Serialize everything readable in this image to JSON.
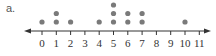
{
  "problem_label": "a.",
  "chart_data": {
    "type": "scatter",
    "subtype": "dot_plot",
    "title": "",
    "xlabel": "",
    "ylabel": "",
    "x_ticks": [
      0,
      1,
      2,
      3,
      4,
      5,
      6,
      7,
      8,
      9,
      10,
      11
    ],
    "xlim": [
      0,
      11
    ],
    "counts": {
      "0": 1,
      "1": 2,
      "2": 1,
      "3": 0,
      "4": 1,
      "5": 3,
      "6": 2,
      "7": 2,
      "8": 0,
      "9": 0,
      "10": 1,
      "11": 0
    },
    "values": [
      0,
      1,
      1,
      2,
      4,
      5,
      5,
      5,
      6,
      6,
      7,
      7,
      10
    ],
    "arrows": "both",
    "dot_color": "#7a7a7a",
    "axis_color": "#333333"
  }
}
